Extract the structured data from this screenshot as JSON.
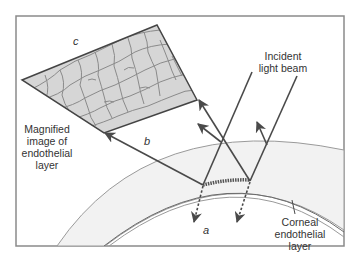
{
  "diagram": {
    "type": "specular microscopy optics",
    "labels": {
      "incident": "Incident\nlight beam",
      "incident_line1": "Incident",
      "incident_line2": "light beam",
      "magnified_line1": "Magnified",
      "magnified_line2": "image of",
      "magnified_line3": "endothelial",
      "magnified_line4": "layer",
      "corneal_line1": "Corneal",
      "corneal_line2": "endothelial",
      "corneal_line3": "layer",
      "a": "a",
      "b": "b",
      "c": "c"
    },
    "colors": {
      "frame": "#8a8a8a",
      "line": "#4a4a4a",
      "cornea_fill": "#f0f0f0",
      "cell_fill": "#d4d4d4",
      "cell_border": "#888888"
    }
  }
}
